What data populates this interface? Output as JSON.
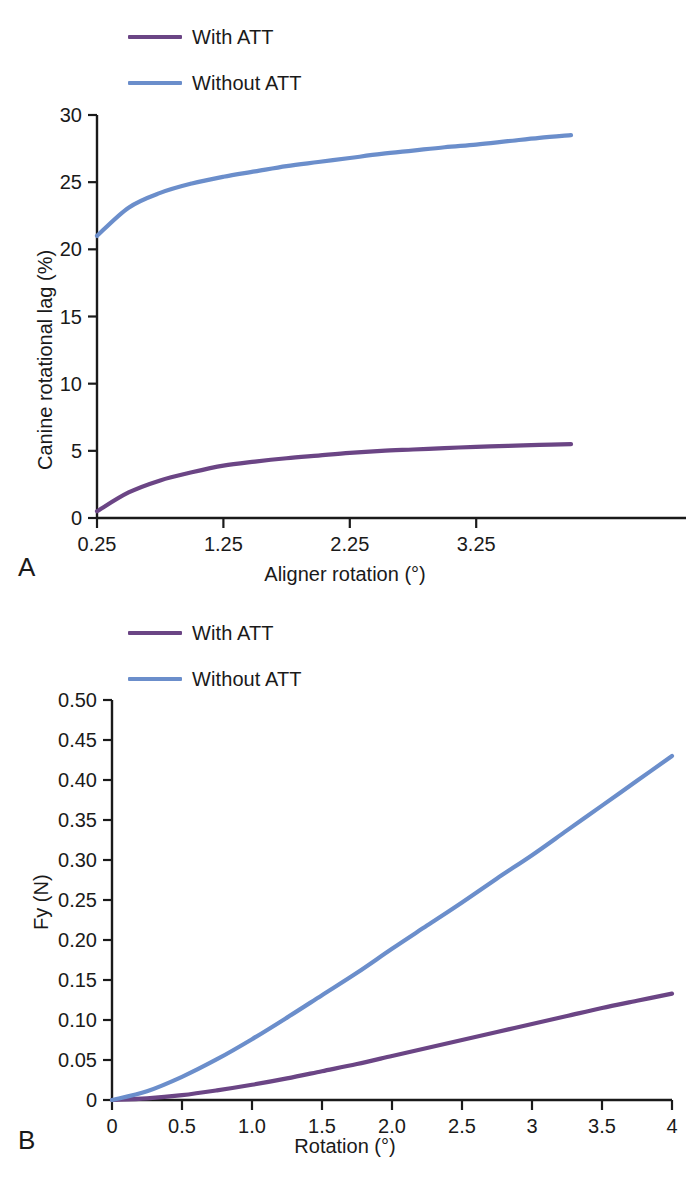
{
  "figure": {
    "panels": [
      {
        "letter": "A",
        "legend": [
          {
            "label": "With ATT",
            "color": "#6B4585",
            "icon": "line-swatch-icon"
          },
          {
            "label": "Without ATT",
            "color": "#6B8ECB",
            "icon": "line-swatch-icon"
          }
        ]
      },
      {
        "letter": "B",
        "legend": [
          {
            "label": "With ATT",
            "color": "#6B4585",
            "icon": "line-swatch-icon"
          },
          {
            "label": "Without ATT",
            "color": "#6B8ECB",
            "icon": "line-swatch-icon"
          }
        ]
      }
    ]
  },
  "chart_data": [
    {
      "type": "line",
      "panel": "A",
      "title": "",
      "xlabel": "Aligner rotation (°)",
      "ylabel": "Canine rotational lag (%)",
      "xlim": [
        0.25,
        4.0
      ],
      "ylim": [
        0,
        30
      ],
      "xticks": [
        0.25,
        1.25,
        2.25,
        3.25
      ],
      "xtick_labels": [
        "0.25",
        "1.25",
        "2.25",
        "3.25"
      ],
      "yticks": [
        0,
        5,
        10,
        15,
        20,
        25,
        30
      ],
      "ytick_labels": [
        "0",
        "5",
        "10",
        "15",
        "20",
        "25",
        "30"
      ],
      "grid": false,
      "legend_position": "above-left",
      "x": [
        0.25,
        0.5,
        0.75,
        1.0,
        1.25,
        1.5,
        1.75,
        2.0,
        2.25,
        2.5,
        2.75,
        3.0,
        3.25,
        3.5,
        3.75,
        4.0
      ],
      "series": [
        {
          "name": "With ATT",
          "color": "#6B4585",
          "values": [
            0.5,
            1.9,
            2.8,
            3.4,
            3.9,
            4.2,
            4.45,
            4.65,
            4.85,
            5.0,
            5.1,
            5.2,
            5.3,
            5.37,
            5.44,
            5.5
          ]
        },
        {
          "name": "Without ATT",
          "color": "#6B8ECB",
          "values": [
            21.0,
            23.1,
            24.2,
            24.9,
            25.4,
            25.8,
            26.2,
            26.5,
            26.8,
            27.1,
            27.35,
            27.6,
            27.8,
            28.05,
            28.3,
            28.5
          ]
        }
      ]
    },
    {
      "type": "line",
      "panel": "B",
      "title": "",
      "xlabel": "Rotation (°)",
      "ylabel": "Fy (N)",
      "xlim": [
        0,
        4
      ],
      "ylim": [
        0,
        0.5
      ],
      "xticks": [
        0,
        0.5,
        1.0,
        1.5,
        2.0,
        2.5,
        3,
        3.5,
        4
      ],
      "xtick_labels": [
        "0",
        "0.5",
        "1.0",
        "1.5",
        "2.0",
        "2.5",
        "3",
        "3.5",
        "4"
      ],
      "yticks": [
        0,
        0.05,
        0.1,
        0.15,
        0.2,
        0.25,
        0.3,
        0.35,
        0.4,
        0.45,
        0.5
      ],
      "ytick_labels": [
        "0",
        "0.05",
        "0.10",
        "0.15",
        "0.20",
        "0.25",
        "0.30",
        "0.35",
        "0.40",
        "0.45",
        "0.50"
      ],
      "grid": false,
      "legend_position": "above-left",
      "x": [
        0,
        0.25,
        0.5,
        0.75,
        1.0,
        1.25,
        1.5,
        1.75,
        2.0,
        2.25,
        2.5,
        2.75,
        3.0,
        3.25,
        3.5,
        3.75,
        4.0
      ],
      "series": [
        {
          "name": "With ATT",
          "color": "#6B4585",
          "values": [
            0.0,
            0.002,
            0.006,
            0.012,
            0.019,
            0.027,
            0.036,
            0.045,
            0.055,
            0.065,
            0.075,
            0.085,
            0.095,
            0.105,
            0.115,
            0.124,
            0.133
          ]
        },
        {
          "name": "Without ATT",
          "color": "#6B8ECB",
          "values": [
            0.0,
            0.011,
            0.029,
            0.051,
            0.076,
            0.103,
            0.131,
            0.159,
            0.189,
            0.218,
            0.247,
            0.277,
            0.306,
            0.337,
            0.368,
            0.399,
            0.43
          ]
        }
      ]
    }
  ]
}
